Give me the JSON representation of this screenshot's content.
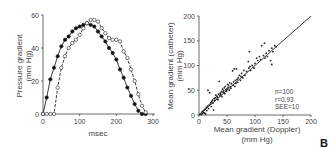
{
  "chart_data": [
    {
      "type": "line",
      "title": "",
      "xlabel": "msec",
      "ylabel": "Pressure gradient (mm Hg)",
      "ylabel_lines": [
        "Pressure gradient",
        "(mm Hg)"
      ],
      "xlim": [
        0,
        300
      ],
      "ylim": [
        0,
        60
      ],
      "xticks": [
        0,
        100,
        200,
        300
      ],
      "yticks": [
        0,
        20,
        40,
        60
      ],
      "grid": false,
      "legend": null,
      "series": [
        {
          "name": "filled circles",
          "marker": "filled-circle",
          "line": "solid",
          "x": [
            0,
            10,
            20,
            30,
            40,
            50,
            60,
            70,
            80,
            90,
            100,
            110,
            120,
            130,
            140,
            150,
            160,
            170,
            180,
            190,
            200,
            210,
            220,
            230,
            240,
            250,
            260,
            270,
            280
          ],
          "y": [
            0,
            10,
            21,
            28,
            35,
            41,
            45,
            47,
            50,
            52,
            53,
            54,
            55,
            54,
            53,
            50,
            47,
            44,
            40,
            37,
            33,
            27,
            22,
            16,
            11,
            6,
            2,
            0,
            0
          ]
        },
        {
          "name": "open circles",
          "marker": "open-circle",
          "line": "dashed",
          "x": [
            0,
            10,
            20,
            30,
            40,
            50,
            60,
            70,
            80,
            90,
            100,
            110,
            120,
            130,
            140,
            150,
            160,
            170,
            180,
            190,
            200,
            210,
            220,
            230,
            240,
            250,
            260,
            270,
            280
          ],
          "y": [
            0,
            0,
            0,
            0,
            16,
            28,
            35,
            40,
            43,
            45,
            48,
            52,
            55,
            57,
            57,
            56,
            52,
            49,
            46,
            45,
            45,
            44,
            38,
            34,
            27,
            20,
            12,
            5,
            1
          ]
        }
      ]
    },
    {
      "type": "scatter",
      "title": "",
      "xlabel": "Mean gradient (Doppler) (mm Hg)",
      "xlabel_lines": [
        "Mean gradient (Doppler)",
        "(mm Hg)"
      ],
      "ylabel": "Mean gradient (catheter) (mm Hg)",
      "ylabel_lines": [
        "Mean gradient (catheter)",
        "(mm Hg)"
      ],
      "xlim": [
        0,
        200
      ],
      "ylim": [
        0,
        200
      ],
      "xticks": [
        0,
        50,
        100,
        150,
        200
      ],
      "yticks": [
        0,
        50,
        100,
        150,
        200
      ],
      "grid": false,
      "annotations": [
        "n=100",
        "r=0.93",
        "SEE=10"
      ],
      "regression_line": {
        "x": [
          0,
          200
        ],
        "y": [
          0,
          200
        ]
      },
      "series": [
        {
          "name": "patients",
          "marker": "filled-dot",
          "points": [
            [
              2,
              2
            ],
            [
              4,
              1
            ],
            [
              5,
              6
            ],
            [
              6,
              3
            ],
            [
              7,
              8
            ],
            [
              8,
              5
            ],
            [
              9,
              10
            ],
            [
              10,
              4
            ],
            [
              11,
              12
            ],
            [
              12,
              2
            ],
            [
              13,
              15
            ],
            [
              14,
              9
            ],
            [
              15,
              18
            ],
            [
              16,
              50
            ],
            [
              17,
              13
            ],
            [
              18,
              20
            ],
            [
              19,
              45
            ],
            [
              20,
              22
            ],
            [
              21,
              25
            ],
            [
              22,
              17
            ],
            [
              23,
              27
            ],
            [
              24,
              30
            ],
            [
              25,
              24
            ],
            [
              26,
              10
            ],
            [
              27,
              33
            ],
            [
              28,
              29
            ],
            [
              29,
              35
            ],
            [
              30,
              40
            ],
            [
              31,
              32
            ],
            [
              32,
              38
            ],
            [
              33,
              36
            ],
            [
              34,
              31
            ],
            [
              35,
              42
            ],
            [
              36,
              68
            ],
            [
              37,
              39
            ],
            [
              38,
              44
            ],
            [
              39,
              41
            ],
            [
              40,
              47
            ],
            [
              41,
              37
            ],
            [
              42,
              52
            ],
            [
              43,
              46
            ],
            [
              44,
              49
            ],
            [
              45,
              55
            ],
            [
              46,
              43
            ],
            [
              47,
              58
            ],
            [
              48,
              51
            ],
            [
              49,
              48
            ],
            [
              50,
              53
            ],
            [
              51,
              62
            ],
            [
              52,
              56
            ],
            [
              53,
              60
            ],
            [
              54,
              50
            ],
            [
              55,
              65
            ],
            [
              56,
              57
            ],
            [
              57,
              54
            ],
            [
              58,
              63
            ],
            [
              60,
              89
            ],
            [
              61,
              60
            ],
            [
              62,
              67
            ],
            [
              63,
              93
            ],
            [
              64,
              58
            ],
            [
              65,
              70
            ],
            [
              66,
              64
            ],
            [
              67,
              93
            ],
            [
              68,
              72
            ],
            [
              69,
              66
            ],
            [
              70,
              75
            ],
            [
              72,
              80
            ],
            [
              74,
              70
            ],
            [
              75,
              78
            ],
            [
              76,
              84
            ],
            [
              78,
              75
            ],
            [
              80,
              90
            ],
            [
              82,
              80
            ],
            [
              85,
              88
            ],
            [
              88,
              108
            ],
            [
              89,
              95
            ],
            [
              90,
              128
            ],
            [
              91,
              98
            ],
            [
              92,
              90
            ],
            [
              95,
              100
            ],
            [
              98,
              95
            ],
            [
              100,
              104
            ],
            [
              103,
              115
            ],
            [
              105,
              110
            ],
            [
              108,
              118
            ],
            [
              110,
              112
            ],
            [
              112,
              140
            ],
            [
              115,
              120
            ],
            [
              117,
              145
            ],
            [
              118,
              115
            ],
            [
              120,
              125
            ],
            [
              122,
              118
            ],
            [
              125,
              130
            ],
            [
              128,
              110
            ],
            [
              130,
              102
            ],
            [
              130,
              135
            ],
            [
              132,
              128
            ],
            [
              135,
              140
            ],
            [
              138,
              138
            ]
          ]
        }
      ]
    }
  ],
  "panel_label": "B",
  "left": {
    "ylabel_line1": "Pressure gradient",
    "ylabel_line2": "(mm Hg)",
    "xlabel": "msec",
    "xticks": [
      "0",
      "100",
      "200",
      "300"
    ],
    "yticks": [
      "0",
      "20",
      "40",
      "60"
    ]
  },
  "right": {
    "ylabel_line1": "Mean gradient (catheter)",
    "ylabel_line2": "(mm Hg)",
    "xlabel_line1": "Mean gradient (Doppler)",
    "xlabel_line2": "(mm Hg)",
    "xticks": [
      "0",
      "50",
      "100",
      "150",
      "200"
    ],
    "yticks": [
      "0",
      "50",
      "100",
      "150",
      "200"
    ],
    "stat_n": "n=100",
    "stat_r": "r=0.93",
    "stat_see": "SEE=10"
  }
}
